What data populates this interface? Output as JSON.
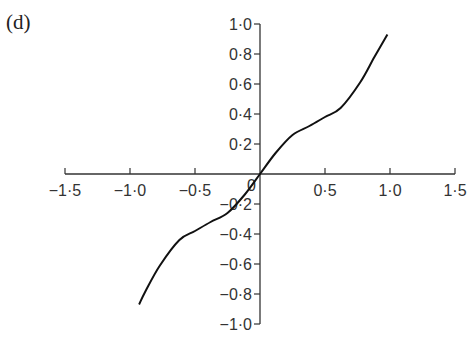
{
  "panel": {
    "label": "(d)"
  },
  "colors": {
    "axis": "#333333",
    "curve": "#111111",
    "background": "#ffffff"
  },
  "chart_data": {
    "type": "line",
    "title": "",
    "xlabel": "",
    "ylabel": "",
    "xlim": [
      -1.5,
      1.5
    ],
    "ylim": [
      -1.0,
      1.0
    ],
    "grid": false,
    "legend": null,
    "x_ticks": [
      -1.5,
      -1.0,
      -0.5,
      0.5,
      1.0,
      1.5
    ],
    "x_tick_labels": [
      "−1·5",
      "−1·0",
      "−0·5",
      "0·5",
      "1·0",
      "1·5"
    ],
    "y_ticks": [
      1.0,
      0.8,
      0.6,
      0.4,
      0.2,
      -0.2,
      -0.4,
      -0.6,
      -0.8,
      -1.0
    ],
    "y_tick_labels": [
      "1·0",
      "0·8",
      "0·6",
      "0·4",
      "0·2",
      "−0·2",
      "−0·4",
      "−0·6",
      "−0·8",
      "−1·0"
    ],
    "origin_label": "0",
    "series": [
      {
        "name": "curve",
        "x": [
          -0.93,
          -0.88,
          -0.77,
          -0.62,
          -0.5,
          -0.38,
          -0.25,
          -0.12,
          0.0,
          0.12,
          0.25,
          0.38,
          0.5,
          0.62,
          0.77,
          0.88,
          0.98
        ],
        "y": [
          -0.87,
          -0.78,
          -0.61,
          -0.44,
          -0.38,
          -0.32,
          -0.26,
          -0.14,
          0.0,
          0.14,
          0.26,
          0.32,
          0.38,
          0.44,
          0.61,
          0.78,
          0.93
        ]
      }
    ]
  }
}
